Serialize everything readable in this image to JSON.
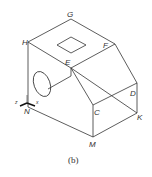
{
  "figure": {
    "caption": "(b)",
    "vertex_labels": {
      "G": "G",
      "H": "H",
      "F": "F",
      "E": "E",
      "D": "D",
      "C": "C",
      "K": "K",
      "M": "M",
      "N": "N"
    },
    "axis_labels": {
      "z": "z",
      "x": "x"
    },
    "line_color": "#333333"
  }
}
